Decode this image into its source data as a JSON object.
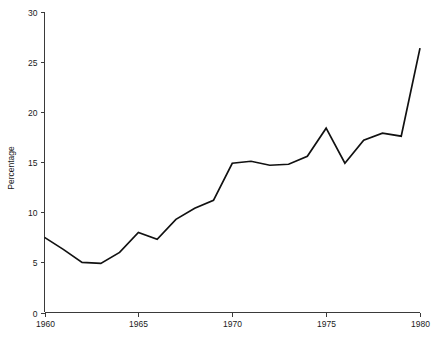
{
  "chart_data": {
    "type": "line",
    "title": "",
    "subtitle": "",
    "xlabel": "",
    "ylabel": "Percentage",
    "x": [
      1960,
      1961,
      1962,
      1963,
      1964,
      1965,
      1966,
      1967,
      1968,
      1969,
      1970,
      1971,
      1972,
      1973,
      1974,
      1975,
      1976,
      1977,
      1978,
      1979,
      1980
    ],
    "values": [
      7.5,
      6.3,
      5.0,
      4.9,
      6.0,
      8.0,
      7.3,
      9.3,
      10.4,
      11.2,
      14.9,
      15.1,
      14.7,
      14.8,
      15.6,
      18.4,
      14.9,
      17.2,
      17.9,
      17.6,
      26.4
    ],
    "series": [
      {
        "name": "Percentage",
        "values": [
          7.5,
          6.3,
          5.0,
          4.9,
          6.0,
          8.0,
          7.3,
          9.3,
          10.4,
          11.2,
          14.9,
          15.1,
          14.7,
          14.8,
          15.6,
          18.4,
          14.9,
          17.2,
          17.9,
          17.6,
          26.4
        ],
        "color": "#111111"
      }
    ],
    "xlim": [
      1960,
      1980
    ],
    "ylim": [
      0,
      30
    ],
    "yticks": [
      0,
      5,
      10,
      15,
      20,
      25,
      30
    ],
    "ytick_labels": [
      "0",
      "5",
      "10",
      "15",
      "20",
      "25",
      "30"
    ],
    "xticks": [
      1960,
      1965,
      1970,
      1975,
      1980
    ],
    "xtick_labels": [
      "1960",
      "1965",
      "1970",
      "1975",
      "1980"
    ],
    "grid": false,
    "legend": false,
    "legend_position": "none",
    "line_color": "#111111",
    "axis_color": "#3a3a3a",
    "background": "#ffffff"
  }
}
